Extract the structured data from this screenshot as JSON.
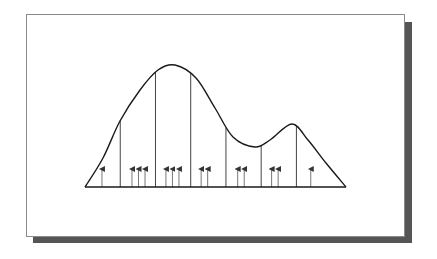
{
  "diagram": {
    "type": "density-histogram-partition",
    "x_range": [
      0,
      1
    ],
    "bin_edges": [
      0.135,
      0.27,
      0.405,
      0.54,
      0.675,
      0.81
    ],
    "samples": [
      0.065,
      0.18,
      0.205,
      0.23,
      0.31,
      0.335,
      0.36,
      0.445,
      0.47,
      0.585,
      0.61,
      0.715,
      0.74,
      0.865
    ],
    "samples_per_bin": [
      1,
      3,
      3,
      2,
      2,
      2,
      1
    ],
    "curve": {
      "modes": [
        0.33,
        0.795
      ],
      "trough": 0.665
    },
    "colors": {
      "curve": "#1a1a1a",
      "bin_lines": "#444444",
      "arrows": "#777777",
      "frame_border": "#8a8a8a",
      "shadow": "#555555",
      "background": "#ffffff"
    }
  }
}
